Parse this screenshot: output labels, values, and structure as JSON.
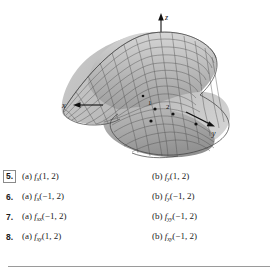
{
  "top_clipped_text": {
    "frag1": "—",
    "frag2": "—",
    "frag3": "—"
  },
  "figure": {
    "caption": "",
    "type": "3d-surface-saddle",
    "axes": {
      "x_label": "x",
      "y_label": "y",
      "z_label": "z"
    },
    "tick_labels": [
      "1",
      "2"
    ],
    "marked_points": 4,
    "surface_fill": "#a8a8a8",
    "surface_fill_light": "#cfcfcf",
    "mesh_color": "#4a4a4a",
    "axis_color": "#111111"
  },
  "exercises": [
    {
      "number": "5.",
      "boxed": true,
      "a": {
        "label": "(a)",
        "fn": "f",
        "sub": "x",
        "args": "(1, 2)"
      },
      "b": {
        "label": "(b)",
        "fn": "f",
        "sub": "y",
        "args": "(1, 2)"
      }
    },
    {
      "number": "6.",
      "boxed": false,
      "a": {
        "label": "(a)",
        "fn": "f",
        "sub": "x",
        "args": "(−1, 2)"
      },
      "b": {
        "label": "(b)",
        "fn": "f",
        "sub": "y",
        "args": "(−1, 2)"
      }
    },
    {
      "number": "7.",
      "boxed": false,
      "a": {
        "label": "(a)",
        "fn": "f",
        "sub": "xx",
        "args": "(−1, 2)"
      },
      "b": {
        "label": "(b)",
        "fn": "f",
        "sub": "yy",
        "args": "(−1, 2)"
      }
    },
    {
      "number": "8.",
      "boxed": false,
      "a": {
        "label": "(a)",
        "fn": "f",
        "sub": "xy",
        "args": "(1, 2)"
      },
      "b": {
        "label": "(b)",
        "fn": "f",
        "sub": "xy",
        "args": "(−1, 2)"
      }
    }
  ]
}
